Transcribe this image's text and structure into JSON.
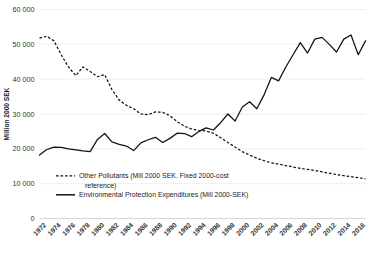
{
  "chart_data": {
    "type": "line",
    "title": "",
    "subtitle": "",
    "xlabel": "",
    "ylabel": "Million 2000 SEK",
    "ylim": [
      0,
      60000
    ],
    "yticks": [
      0,
      10000,
      20000,
      30000,
      40000,
      50000,
      60000
    ],
    "ytick_labels": [
      "0",
      "10 000",
      "20 000",
      "30 000",
      "40 000",
      "50 000",
      "60 000"
    ],
    "xlim": [
      1971,
      2016
    ],
    "xticks": [
      1972,
      1974,
      1976,
      1978,
      1980,
      1982,
      1984,
      1986,
      1988,
      1990,
      1992,
      1994,
      1996,
      1998,
      2000,
      2002,
      2004,
      2006,
      2008,
      2010,
      2012,
      2014,
      2016
    ],
    "xtick_labels": [
      "1972",
      "1974",
      "1976",
      "1978",
      "1980",
      "1982",
      "1984",
      "1986",
      "1988",
      "1990",
      "1992",
      "1994",
      "1996",
      "1998",
      "2000",
      "2002",
      "2004",
      "2006",
      "2008",
      "2010",
      "2012",
      "2014",
      "2016"
    ],
    "grid": true,
    "grid_axis": "y",
    "legend_position": "inside-lower-left",
    "x": [
      1971,
      1972,
      1973,
      1974,
      1975,
      1976,
      1977,
      1978,
      1979,
      1980,
      1981,
      1982,
      1983,
      1984,
      1985,
      1986,
      1987,
      1988,
      1989,
      1990,
      1991,
      1992,
      1993,
      1994,
      1995,
      1996,
      1997,
      1998,
      1999,
      2000,
      2001,
      2002,
      2003,
      2004,
      2005,
      2006,
      2007,
      2008,
      2009,
      2010,
      2011,
      2012,
      2013,
      2014,
      2015,
      2016
    ],
    "series": [
      {
        "name": "Other Pollutants (Mill 2000 SEK. Fixed 2000-cost reference)",
        "style": "dashed",
        "color": "#111111",
        "values": [
          51800,
          52300,
          51000,
          47000,
          43500,
          41000,
          43500,
          42200,
          40700,
          41300,
          37000,
          34000,
          32500,
          31500,
          30000,
          29800,
          30600,
          30500,
          29500,
          27800,
          26500,
          25700,
          25300,
          25100,
          24500,
          23200,
          21800,
          20500,
          19200,
          18200,
          17300,
          16600,
          16000,
          15600,
          15200,
          14800,
          14400,
          14100,
          13800,
          13400,
          13000,
          12600,
          12300,
          12000,
          11700,
          11400
        ]
      },
      {
        "name": "Environmental Protection Expenditures (Mill 2000-SEK)",
        "style": "solid",
        "color": "#111111",
        "values": [
          18200,
          19800,
          20500,
          20400,
          20000,
          19700,
          19400,
          19200,
          22700,
          24400,
          22000,
          21300,
          20800,
          19500,
          21700,
          22600,
          23300,
          21800,
          23000,
          24500,
          24400,
          23500,
          25000,
          26000,
          25400,
          27500,
          30000,
          28000,
          32000,
          33500,
          31500,
          35500,
          40500,
          39500,
          43500,
          47000,
          50500,
          47500,
          51500,
          52000,
          50000,
          47800,
          51500,
          52700,
          47000,
          51000
        ]
      }
    ],
    "legend": [
      {
        "label": "Other Pollutants (Mill 2000 SEK. Fixed 2000-cost",
        "label_line2": "reference)",
        "style": "dashed"
      },
      {
        "label": "Environmental Protection Expenditures (Mill 2000-SEK)",
        "label_line2": "",
        "style": "solid"
      }
    ]
  }
}
